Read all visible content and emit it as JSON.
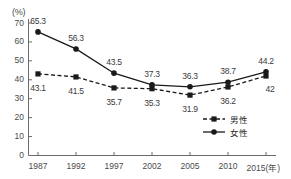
{
  "chart_data": {
    "type": "line",
    "title": "",
    "subtitle": "",
    "xlabel": "(年)",
    "ylabel": "(%)",
    "unit_label": "(%)",
    "xaxis_suffix": "(年)",
    "categories": [
      "1987",
      "1992",
      "1997",
      "2002",
      "2005",
      "2010",
      "2015"
    ],
    "ylim": [
      0,
      70
    ],
    "ytick_labels": [
      "0",
      "10",
      "20",
      "30",
      "40",
      "50",
      "60",
      "70"
    ],
    "ytick_values": [
      0,
      10,
      20,
      30,
      40,
      50,
      60,
      70
    ],
    "grid": false,
    "legend_position": "bottom-right",
    "series": [
      {
        "name": "男性",
        "style": "dashed",
        "marker": "square",
        "color": "#1a1a1a",
        "values": [
          43.1,
          41.5,
          35.7,
          35.3,
          31.9,
          36.2,
          42
        ],
        "labels": [
          "43.1",
          "41.5",
          "35.7",
          "35.3",
          "31.9",
          "36.2",
          "42"
        ]
      },
      {
        "name": "女性",
        "style": "solid",
        "marker": "circle",
        "color": "#1a1a1a",
        "values": [
          65.3,
          56.3,
          43.5,
          37.3,
          36.3,
          38.7,
          44.2
        ],
        "labels": [
          "65.3",
          "56.3",
          "43.5",
          "37.3",
          "36.3",
          "38.7",
          "44.2"
        ]
      }
    ]
  },
  "legend": {
    "items": [
      {
        "label": "男性",
        "style": "dashed",
        "marker": "square"
      },
      {
        "label": "女性",
        "style": "solid",
        "marker": "circle"
      }
    ]
  },
  "colors": {
    "axis": "#6b6b6b",
    "line": "#1a1a1a",
    "text": "#4a4a4a",
    "background": "#ffffff"
  }
}
